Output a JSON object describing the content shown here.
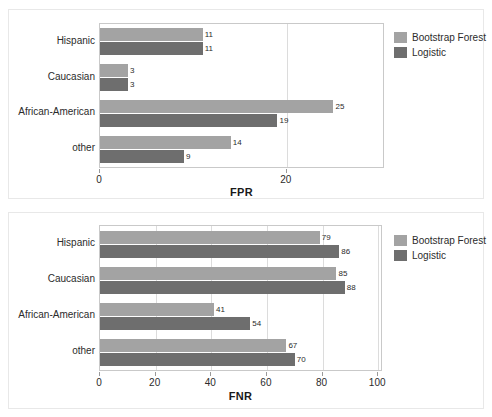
{
  "figure": {
    "background": "#ffffff",
    "series_colors": {
      "bootstrap_forest": "#a3a3a3",
      "logistic": "#6e6e6e"
    }
  },
  "legend": {
    "bootstrap_forest_label": "Bootstrap Forest",
    "logistic_label": "Logistic"
  },
  "chart_data": [
    {
      "type": "bar",
      "orientation": "horizontal",
      "title": "",
      "xlabel": "FPR",
      "ylabel": "",
      "xlim": [
        0,
        30.3
      ],
      "xticks": [
        0,
        20
      ],
      "xtick_labels": [
        "0",
        "20"
      ],
      "grid": true,
      "legend_position": "right",
      "categories": [
        "Hispanic",
        "Caucasian",
        "African-American",
        "other"
      ],
      "series": [
        {
          "name": "Bootstrap Forest",
          "color": "#a3a3a3",
          "values": [
            11,
            3,
            25,
            14
          ]
        },
        {
          "name": "Logistic",
          "color": "#6e6e6e",
          "values": [
            11,
            3,
            19,
            9
          ]
        }
      ]
    },
    {
      "type": "bar",
      "orientation": "horizontal",
      "title": "",
      "xlabel": "FNR",
      "ylabel": "",
      "xlim": [
        0,
        101
      ],
      "xticks": [
        0,
        20,
        40,
        60,
        80,
        100
      ],
      "xtick_labels": [
        "0",
        "20",
        "40",
        "60",
        "80",
        "100"
      ],
      "grid": true,
      "legend_position": "right",
      "categories": [
        "Hispanic",
        "Caucasian",
        "African-American",
        "other"
      ],
      "series": [
        {
          "name": "Bootstrap Forest",
          "color": "#a3a3a3",
          "values": [
            79,
            85,
            41,
            67
          ]
        },
        {
          "name": "Logistic",
          "color": "#6e6e6e",
          "values": [
            86,
            88,
            54,
            70
          ]
        }
      ]
    }
  ]
}
